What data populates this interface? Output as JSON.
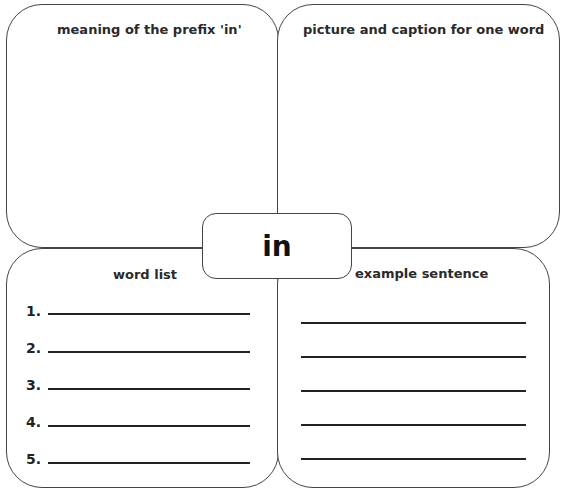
{
  "center_word": "in",
  "quadrants": {
    "top_left": {
      "title": "meaning of the prefix 'in'"
    },
    "top_right": {
      "title": "picture and caption for one word"
    },
    "bottom_left": {
      "title": "word list",
      "items": [
        "1.",
        "2.",
        "3.",
        "4.",
        "5."
      ]
    },
    "bottom_right": {
      "title": "example sentence",
      "line_count": 5
    }
  }
}
